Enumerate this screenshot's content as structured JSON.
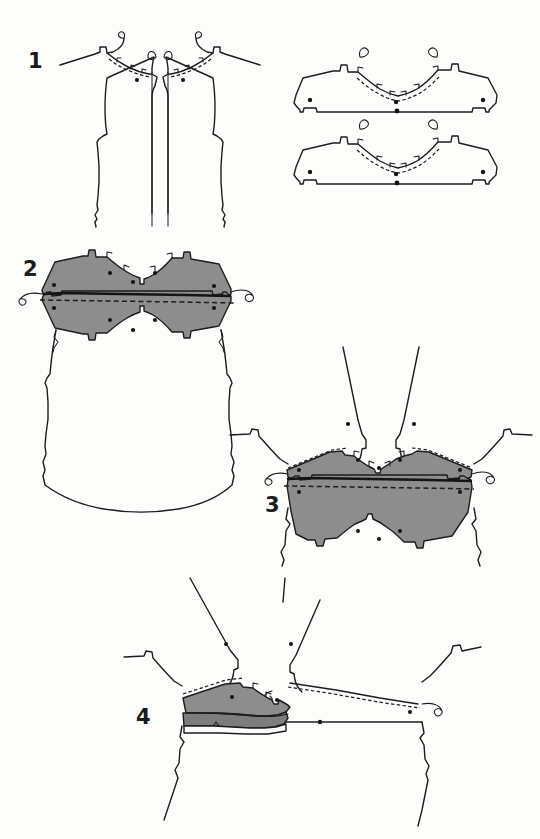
{
  "document": {
    "type": "sewing-pattern-instruction-illustration",
    "title": "Yoke attachment sequence",
    "background_color": "#fdfdfc",
    "ink_color": "#1d1d1d",
    "yoke_fill_color": "#8d8d8d",
    "yoke_fill_color_dark": "#7a7a7a"
  },
  "steps": [
    {
      "id": "step-1",
      "label": "1",
      "label_x": 28,
      "label_y": 68,
      "caption": "Bodice front opened flat with two yoke pattern pieces at right"
    },
    {
      "id": "step-2",
      "label": "2",
      "label_x": 23,
      "label_y": 276,
      "caption": "Yoke pieces joined and placed across bodice shoulders"
    },
    {
      "id": "step-3",
      "label": "3",
      "label_x": 265,
      "label_y": 512,
      "caption": "Yoke stitched to bodice, shoulder seams raised"
    },
    {
      "id": "step-4",
      "label": "4",
      "label_x": 136,
      "label_y": 724,
      "caption": "Yoke folded back over the seam allowance"
    }
  ],
  "markings": {
    "dot": "pattern-marking-dot",
    "notch": "pattern-notch",
    "dashed_line": "seam-allowance-stitch-line",
    "solid_line": "cut-edge-line",
    "curl": "tailor-thread-mark-curl"
  }
}
